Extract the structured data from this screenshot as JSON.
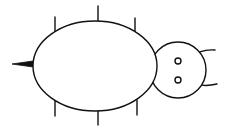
{
  "figure": {
    "colors": {
      "line": "#111111",
      "background": "#ffffff"
    },
    "parts": {
      "body": {
        "cx": 95,
        "cy": 66,
        "rx": 62,
        "ry": 45
      },
      "head": {
        "cx": 178,
        "cy": 70,
        "r": 28
      },
      "eyes": [
        {
          "cx": 178,
          "cy": 61,
          "r": 3
        },
        {
          "cx": 178,
          "cy": 80,
          "r": 3
        }
      ],
      "legs_top": [
        {
          "x": 55,
          "y1": 17,
          "y2": 34
        },
        {
          "x": 98,
          "y1": 6,
          "y2": 21
        },
        {
          "x": 135,
          "y1": 18,
          "y2": 33
        }
      ],
      "legs_bottom": [
        {
          "x": 55,
          "y1": 100,
          "y2": 116
        },
        {
          "x": 98,
          "y1": 111,
          "y2": 125
        },
        {
          "x": 137,
          "y1": 100,
          "y2": 115
        }
      ],
      "tail": {
        "tip_x": 12,
        "base_x": 33,
        "y": 64
      }
    }
  }
}
